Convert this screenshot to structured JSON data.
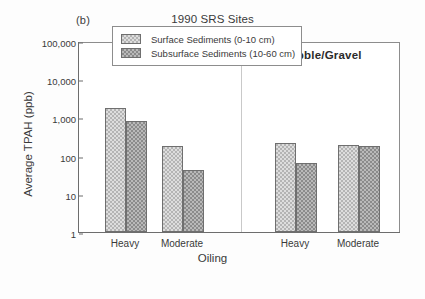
{
  "panel": {
    "label": "(b)"
  },
  "chart_data": {
    "type": "bar",
    "title": "1990 SRS Sites",
    "xlabel": "Oiling",
    "ylabel": "Average TPAH (ppb)",
    "yscale": "log",
    "ylim": [
      1,
      100000
    ],
    "ytick_labels": [
      "100,000",
      "10,000",
      "1,000",
      "100",
      "10",
      "1"
    ],
    "ytick_values": [
      100000,
      10000,
      1000,
      100,
      10,
      1
    ],
    "grid": false,
    "legend_position": "upper center",
    "groups": [
      {
        "name": "Boulder/Cobble"
      },
      {
        "name": "Pebble/Gravel"
      }
    ],
    "categories": [
      "Heavy",
      "Moderate",
      "Heavy",
      "Moderate"
    ],
    "series": [
      {
        "name": "Surface Sediments (0-10 cm)",
        "key": "surface",
        "color": "#b4b4b4",
        "values": [
          1800,
          180,
          210,
          190
        ]
      },
      {
        "name": "Subsurface Sediments (10-60 cm)",
        "key": "subsurface",
        "color": "#8b8b8b",
        "values": [
          800,
          42,
          65,
          175
        ]
      }
    ],
    "bars": [
      {
        "group": "Boulder/Cobble",
        "category": "Heavy",
        "series": "Surface Sediments (0-10 cm)",
        "value": 1800
      },
      {
        "group": "Boulder/Cobble",
        "category": "Heavy",
        "series": "Subsurface Sediments (10-60 cm)",
        "value": 800
      },
      {
        "group": "Boulder/Cobble",
        "category": "Moderate",
        "series": "Surface Sediments (0-10 cm)",
        "value": 180
      },
      {
        "group": "Boulder/Cobble",
        "category": "Moderate",
        "series": "Subsurface Sediments (10-60 cm)",
        "value": 42
      },
      {
        "group": "Pebble/Gravel",
        "category": "Heavy",
        "series": "Surface Sediments (0-10 cm)",
        "value": 210
      },
      {
        "group": "Pebble/Gravel",
        "category": "Heavy",
        "series": "Subsurface Sediments (10-60 cm)",
        "value": 65
      },
      {
        "group": "Pebble/Gravel",
        "category": "Moderate",
        "series": "Surface Sediments (0-10 cm)",
        "value": 190
      },
      {
        "group": "Pebble/Gravel",
        "category": "Moderate",
        "series": "Subsurface Sediments (10-60 cm)",
        "value": 175
      }
    ]
  }
}
